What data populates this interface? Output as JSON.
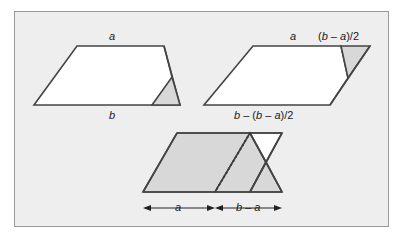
{
  "figure": {
    "background_color": "#ffffff",
    "panel_fill": "#eeeeee",
    "panel_border_color": "#9a9a9a",
    "shaded_fill": "#d8d8d8",
    "white_fill": "#ffffff",
    "stroke_color": "#444444",
    "labels": {
      "left_top": "a",
      "left_bottom": "b",
      "right_top": "a",
      "right_corner": "(b – a)/2",
      "right_bottom": "b – (b – a)/2",
      "dim_left": "a",
      "dim_right": "b – a"
    }
  }
}
